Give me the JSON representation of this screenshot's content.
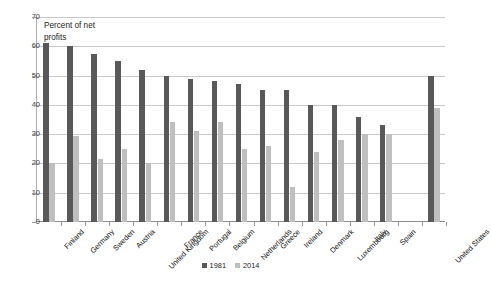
{
  "chart_data": {
    "type": "bar",
    "title": "",
    "axis_note": "Percent of net\nprofits",
    "axis_note_line1": "Percent of net",
    "axis_note_line2": "profits",
    "xlabel": "",
    "ylabel": "Percent of net profits",
    "ylim": [
      0,
      70
    ],
    "ytick_step": 10,
    "yticks": [
      0,
      10,
      20,
      30,
      40,
      50,
      60,
      70
    ],
    "ytick_labels": [
      "0",
      "10",
      "20",
      "30",
      "40",
      "50",
      "60",
      "70"
    ],
    "grid": true,
    "legend_position": "bottom-center",
    "categories": [
      "Finland",
      "Germany",
      "Sweden",
      "Austria",
      "United Kingdom",
      "France",
      "Portugal",
      "Belgium",
      "Netherlands",
      "Greece",
      "Ireland",
      "Denmark",
      "Luxembourg",
      "Italy",
      "Spain",
      "",
      "United States"
    ],
    "series": [
      {
        "name": "1981",
        "color": "#595959",
        "values": [
          61,
          60,
          57.5,
          55,
          52,
          50,
          49,
          48,
          47,
          45,
          45,
          40,
          40,
          36,
          33,
          null,
          50
        ]
      },
      {
        "name": "2014",
        "color": "#bfbfbf",
        "values": [
          20,
          29.5,
          21.5,
          25,
          20,
          34,
          31,
          34,
          25,
          26,
          12,
          24,
          28,
          30,
          30,
          null,
          39
        ]
      }
    ],
    "legend": [
      {
        "label": "1981",
        "color": "#595959"
      },
      {
        "label": "2014",
        "color": "#bfbfbf"
      }
    ]
  }
}
